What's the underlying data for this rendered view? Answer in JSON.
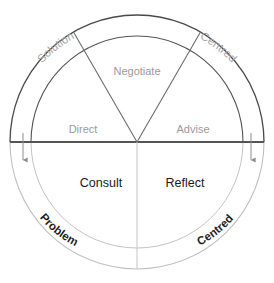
{
  "diagram": {
    "geometry": {
      "center_x": 137,
      "center_y": 142,
      "outer_radius": 127,
      "inner_radius": 106
    },
    "colors": {
      "arc_top": "#4a4a4a",
      "arc_bottom": "#b9b9b9",
      "diameter_line": "#555555",
      "divider_line": "#6b6b6b",
      "label_gray": "#9a9a9a",
      "label_dark": "#1a1a1a",
      "arrow": "#8d8d8d",
      "background": "#ffffff"
    },
    "inner_sectors": [
      {
        "id": "direct",
        "label": "Direct",
        "style": "gray",
        "x": 83,
        "y": 133
      },
      {
        "id": "negotiate",
        "label": "Negotiate",
        "style": "gray",
        "x": 137,
        "y": 75
      },
      {
        "id": "advise",
        "label": "Advise",
        "style": "gray",
        "x": 193,
        "y": 133
      },
      {
        "id": "consult",
        "label": "Consult",
        "style": "dark",
        "x": 101,
        "y": 187
      },
      {
        "id": "reflect",
        "label": "Reflect",
        "style": "dark",
        "x": 185,
        "y": 187
      }
    ],
    "outer_ring_labels": [
      {
        "id": "solution",
        "label": "Solution",
        "style": "gray",
        "position": "top-left"
      },
      {
        "id": "centred-top",
        "label": "Centred",
        "style": "gray",
        "position": "top-right"
      },
      {
        "id": "problem",
        "label": "Problem",
        "style": "dark",
        "position": "bottom-left"
      },
      {
        "id": "centred-bottom",
        "label": "Centred",
        "style": "dark",
        "position": "bottom-right"
      }
    ],
    "arrows": [
      {
        "id": "arrow-left",
        "direction": "down",
        "x": 23,
        "y_top": 140,
        "y_bottom": 160
      },
      {
        "id": "arrow-right",
        "direction": "down",
        "x": 251,
        "y_top": 140,
        "y_bottom": 160
      }
    ]
  }
}
